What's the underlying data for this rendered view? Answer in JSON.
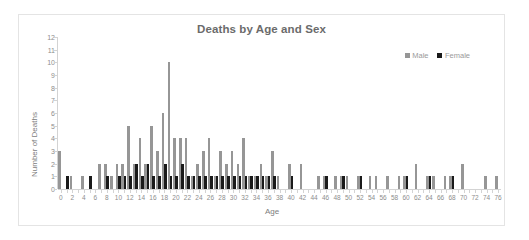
{
  "chart_data": {
    "type": "bar",
    "title": "Deaths by Age and Sex",
    "xlabel": "Age",
    "ylabel": "Number of Deaths",
    "xlim": [
      0,
      76
    ],
    "ylim": [
      0,
      12
    ],
    "ytick_step": 1,
    "xtick_step": 2,
    "grid": false,
    "legend_position": "top-right",
    "categories": [
      0,
      1,
      2,
      3,
      4,
      5,
      6,
      7,
      8,
      9,
      10,
      11,
      12,
      13,
      14,
      15,
      16,
      17,
      18,
      19,
      20,
      21,
      22,
      23,
      24,
      25,
      26,
      27,
      28,
      29,
      30,
      31,
      32,
      33,
      34,
      35,
      36,
      37,
      38,
      39,
      40,
      41,
      42,
      43,
      44,
      45,
      46,
      47,
      48,
      49,
      50,
      51,
      52,
      53,
      54,
      55,
      56,
      57,
      58,
      59,
      60,
      61,
      62,
      63,
      64,
      65,
      66,
      67,
      68,
      69,
      70,
      71,
      72,
      73,
      74,
      75,
      76
    ],
    "series": [
      {
        "name": "Male",
        "color": "#969696",
        "values": [
          3,
          0,
          1,
          0,
          1,
          0,
          0,
          2,
          2,
          1,
          2,
          2,
          5,
          2,
          4,
          2,
          5,
          3,
          6,
          10,
          4,
          4,
          4,
          1,
          2,
          3,
          4,
          1,
          3,
          2,
          3,
          2,
          4,
          1,
          1,
          2,
          1,
          3,
          1,
          0,
          2,
          0,
          2,
          0,
          0,
          1,
          1,
          0,
          1,
          1,
          1,
          0,
          1,
          0,
          1,
          1,
          0,
          1,
          0,
          1,
          1,
          0,
          2,
          0,
          1,
          1,
          0,
          1,
          1,
          0,
          2,
          0,
          0,
          0,
          1,
          0,
          1
        ]
      },
      {
        "name": "Female",
        "color": "#1a1a1a",
        "values": [
          0,
          1,
          0,
          0,
          0,
          1,
          0,
          0,
          1,
          0,
          1,
          1,
          1,
          2,
          1,
          2,
          1,
          1,
          2,
          1,
          1,
          2,
          1,
          1,
          1,
          1,
          1,
          1,
          1,
          1,
          1,
          1,
          1,
          1,
          1,
          1,
          1,
          1,
          0,
          0,
          1,
          0,
          0,
          0,
          0,
          0,
          1,
          0,
          0,
          1,
          0,
          0,
          1,
          0,
          0,
          0,
          0,
          0,
          0,
          0,
          1,
          0,
          0,
          0,
          1,
          0,
          0,
          0,
          1,
          0,
          0,
          0,
          0,
          0,
          0,
          0,
          0
        ]
      }
    ]
  },
  "legend": {
    "items": [
      {
        "label": "Male",
        "color": "#969696"
      },
      {
        "label": "Female",
        "color": "#1a1a1a"
      }
    ]
  }
}
